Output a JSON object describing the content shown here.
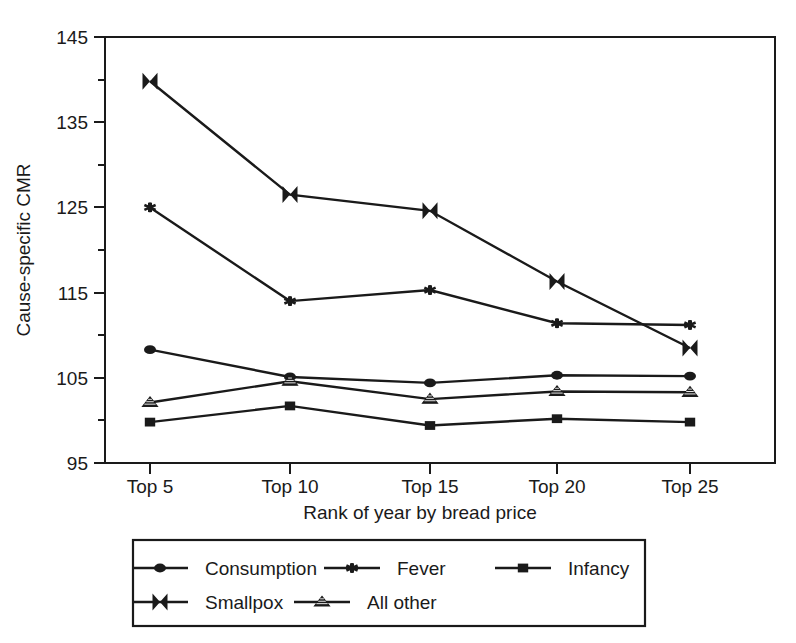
{
  "chart_data": {
    "type": "line",
    "title": "",
    "xlabel": "Rank of year by bread price",
    "ylabel": "Cause-specific CMR",
    "categories": [
      "Top 5",
      "Top 10",
      "Top 15",
      "Top 20",
      "Top 25"
    ],
    "ylim": [
      95,
      145
    ],
    "yticks": [
      95,
      105,
      115,
      125,
      135,
      145
    ],
    "yticks_minor": [
      100,
      110,
      120,
      130,
      140
    ],
    "grid": false,
    "legend_position": "bottom",
    "series": [
      {
        "name": "Consumption",
        "marker": "circle",
        "values": [
          108.3,
          105.1,
          104.4,
          105.3,
          105.2
        ]
      },
      {
        "name": "Fever",
        "marker": "star",
        "values": [
          125.0,
          114.0,
          115.3,
          111.4,
          111.2
        ]
      },
      {
        "name": "Infancy",
        "marker": "square",
        "values": [
          99.8,
          101.7,
          99.4,
          100.2,
          99.8
        ]
      },
      {
        "name": "Smallpox",
        "marker": "bowtie",
        "values": [
          139.8,
          126.5,
          124.6,
          116.3,
          108.5
        ]
      },
      {
        "name": "All other",
        "marker": "triangle",
        "values": [
          102.1,
          104.6,
          102.5,
          103.4,
          103.3
        ]
      }
    ]
  },
  "axes": {
    "y_tick_labels": [
      "145",
      "135",
      "125",
      "115",
      "105",
      "95"
    ],
    "x_tick_labels": [
      "Top 5",
      "Top 10",
      "Top 15",
      "Top 20",
      "Top 25"
    ],
    "y_axis_title": "Cause-specific CMR",
    "x_axis_title": "Rank of year by bread price"
  },
  "legend": {
    "entries": [
      {
        "label": "Consumption",
        "marker": "circle-marker"
      },
      {
        "label": "Fever",
        "marker": "star-marker"
      },
      {
        "label": "Infancy",
        "marker": "square-marker"
      },
      {
        "label": "Smallpox",
        "marker": "bowtie-marker"
      },
      {
        "label": "All other",
        "marker": "triangle-marker"
      }
    ]
  },
  "colors": {
    "ink": "#1a1a1a",
    "background": "#ffffff"
  }
}
